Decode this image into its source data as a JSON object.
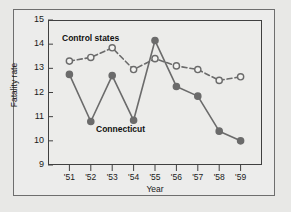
{
  "figure": {
    "background_color": "#e8e8e6",
    "panel_color": "#ececea",
    "frame_color": "#6e6e6e"
  },
  "chart_data": {
    "type": "line",
    "title": "",
    "xlabel": "Year",
    "ylabel": "Fatality rate",
    "xlim": [
      0,
      10
    ],
    "ylim": [
      9,
      15
    ],
    "grid": false,
    "legend_position": "inline-annotations",
    "categories": [
      "'51",
      "'52",
      "'53",
      "'54",
      "'55",
      "'56",
      "'57",
      "'58",
      "'59"
    ],
    "ytick_labels": [
      "15",
      "14",
      "13",
      "12",
      "11",
      "10",
      "9"
    ],
    "ytick_values": [
      15,
      14,
      13,
      12,
      11,
      10,
      9
    ],
    "series": [
      {
        "name": "Control states",
        "values": [
          13.3,
          13.45,
          13.85,
          12.95,
          13.4,
          13.1,
          12.95,
          12.5,
          12.65
        ],
        "line_style": "dashed",
        "marker": "open-circle",
        "color": "#6b6b6b",
        "marker_fill": "#f2f2f0"
      },
      {
        "name": "Connecticut",
        "values": [
          12.75,
          10.8,
          12.7,
          10.85,
          14.15,
          12.25,
          11.85,
          10.4,
          10.0
        ],
        "line_style": "solid",
        "marker": "filled-circle",
        "color": "#6b6b6b",
        "marker_fill": "#6b6b6b"
      }
    ],
    "annotations": [
      {
        "text": "Control states",
        "series": "Control states"
      },
      {
        "text": "Connecticut",
        "series": "Connecticut"
      }
    ]
  }
}
